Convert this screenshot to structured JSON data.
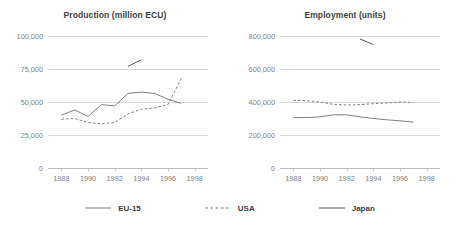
{
  "legend": {
    "items": [
      {
        "label": "EU-15",
        "style": "solid",
        "color": "#7f7f7f"
      },
      {
        "label": "USA",
        "style": "dashed",
        "color": "#7f7f7f"
      },
      {
        "label": "Japan",
        "style": "solid",
        "color": "#595959"
      }
    ]
  },
  "chart_data": [
    {
      "type": "line",
      "title": "Production (million ECU)",
      "xlabel": "",
      "ylabel": "",
      "xlim": [
        1987,
        1999
      ],
      "ylim": [
        0,
        100000
      ],
      "yticks": [
        0,
        25000,
        50000,
        75000,
        100000
      ],
      "ytick_labels": [
        "0",
        "25,000",
        "50,000",
        "75,000",
        "100,000"
      ],
      "xticks": [
        1988,
        1990,
        1992,
        1994,
        1996,
        1998
      ],
      "xtick_labels": [
        "1988",
        "1990",
        "1992",
        "1994",
        "1996",
        "1998"
      ],
      "grid": true,
      "legend_position": "bottom",
      "series": [
        {
          "name": "EU-15",
          "style": "solid",
          "color": "#7f7f7f",
          "x": [
            1988,
            1989,
            1990,
            1991,
            1992,
            1993,
            1994,
            1995,
            1996,
            1997
          ],
          "values": [
            40000,
            44000,
            39000,
            48000,
            47000,
            56500,
            57500,
            56500,
            52000,
            49000
          ]
        },
        {
          "name": "USA",
          "style": "dashed",
          "color": "#7f7f7f",
          "x": [
            1988,
            1989,
            1990,
            1991,
            1992,
            1993,
            1994,
            1995,
            1996,
            1997
          ],
          "values": [
            37000,
            37500,
            34500,
            33500,
            34500,
            41000,
            44500,
            45500,
            48000,
            68000
          ]
        },
        {
          "name": "Japan",
          "style": "solid",
          "color": "#595959",
          "x": [
            1993,
            1994
          ],
          "values": [
            77000,
            82000
          ]
        }
      ]
    },
    {
      "type": "line",
      "title": "Employment (units)",
      "xlabel": "",
      "ylabel": "",
      "xlim": [
        1987,
        1999
      ],
      "ylim": [
        0,
        800000
      ],
      "yticks": [
        0,
        200000,
        400000,
        600000,
        800000
      ],
      "ytick_labels": [
        "0",
        "200,000",
        "400,000",
        "600,000",
        "800,000"
      ],
      "xticks": [
        1988,
        1990,
        1992,
        1994,
        1996,
        1998
      ],
      "xtick_labels": [
        "1988",
        "1990",
        "1992",
        "1994",
        "1996",
        "1998"
      ],
      "grid": true,
      "legend_position": "bottom",
      "series": [
        {
          "name": "EU-15",
          "style": "solid",
          "color": "#7f7f7f",
          "x": [
            1988,
            1989,
            1990,
            1991,
            1992,
            1993,
            1994,
            1995,
            1996,
            1997
          ],
          "values": [
            305000,
            306000,
            310000,
            322000,
            322000,
            310000,
            300000,
            292000,
            286000,
            278000
          ]
        },
        {
          "name": "USA",
          "style": "dashed",
          "color": "#7f7f7f",
          "x": [
            1988,
            1989,
            1990,
            1991,
            1992,
            1993,
            1994,
            1995,
            1996,
            1997
          ],
          "values": [
            410000,
            408000,
            400000,
            386000,
            382000,
            384000,
            390000,
            394000,
            400000,
            398000
          ]
        },
        {
          "name": "Japan",
          "style": "solid",
          "color": "#595959",
          "x": [
            1993,
            1994
          ],
          "values": [
            782000,
            748000
          ]
        }
      ]
    }
  ]
}
